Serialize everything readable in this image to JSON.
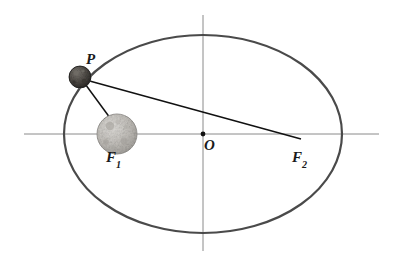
{
  "figure": {
    "title": "",
    "type": "ellipse-orbit-diagram",
    "background_color": "#ffffff",
    "canvas": {
      "width": 402,
      "height": 268
    }
  },
  "labels": {
    "point_p": "P",
    "center_o": "O",
    "focus_1_base": "F",
    "focus_1_sub": "1",
    "focus_2_base": "F",
    "focus_2_sub": "2"
  },
  "geometry": {
    "ellipse": {
      "center_x": 203,
      "center_y": 134,
      "semi_major_axis": 139,
      "semi_minor_axis": 99,
      "stroke_color": "#4a4a4a",
      "stroke_width": 2.2
    },
    "horizontal_axis": {
      "x1": 24,
      "y1": 134,
      "x2": 379,
      "y2": 134,
      "stroke_color": "#8a8a8a",
      "stroke_width": 1
    },
    "vertical_axis": {
      "x1": 203,
      "y1": 15,
      "x2": 203,
      "y2": 251,
      "stroke_color": "#8a8a8a",
      "stroke_width": 1
    },
    "center_dot": {
      "cx": 203,
      "cy": 134,
      "r": 2.4,
      "color": "#111111"
    },
    "body_p": {
      "cx": 80,
      "cy": 77,
      "r": 11,
      "fill_color": "#5a5550",
      "stroke_color": "#1c1c1c",
      "description": "small rocky asteroid at point P on the ellipse"
    },
    "body_f1": {
      "cx": 117,
      "cy": 134,
      "r": 20,
      "fill_color": "#b9b6b1",
      "stroke_color": "#8d8a86",
      "description": "large cratered moon-like sphere at focus F1"
    },
    "segment_p_to_f1": {
      "x1": 80,
      "y1": 77,
      "x2": 113,
      "y2": 122,
      "stroke_color": "#111111",
      "stroke_width": 1.5
    },
    "segment_p_to_f2": {
      "x1": 86,
      "y1": 80,
      "x2": 301,
      "y2": 139,
      "stroke_color": "#111111",
      "stroke_width": 1.5
    }
  },
  "chart_data": {
    "type": "scatter",
    "xlabel": "",
    "ylabel": "",
    "annotations": [
      "P",
      "O",
      "F1",
      "F2"
    ],
    "points": [
      {
        "name": "P",
        "x": 80,
        "y": 77
      },
      {
        "name": "O",
        "x": 203,
        "y": 134
      },
      {
        "name": "F1",
        "x": 117,
        "y": 134
      },
      {
        "name": "F2",
        "x": 301,
        "y": 139
      }
    ],
    "curves": [
      {
        "name": "orbit-ellipse",
        "center": [
          203,
          134
        ],
        "a": 139,
        "b": 99
      }
    ],
    "grid": false,
    "legend": "none"
  }
}
